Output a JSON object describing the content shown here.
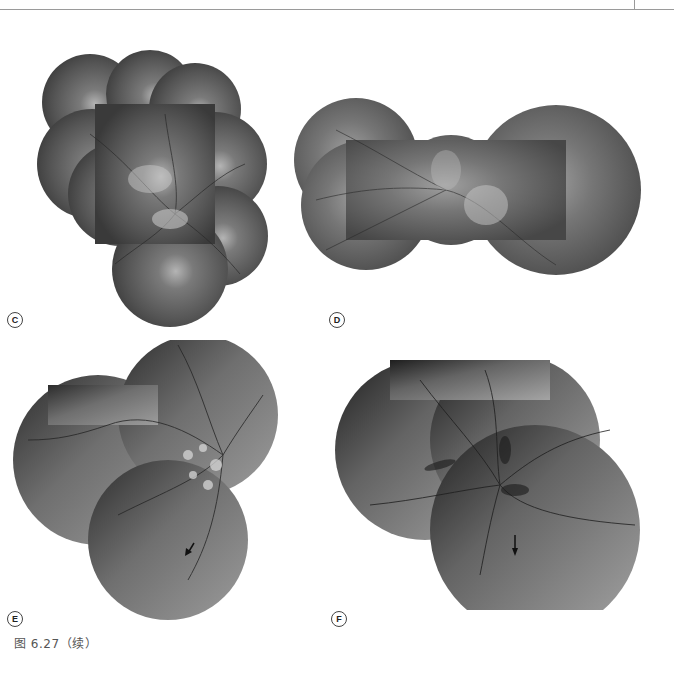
{
  "figure": {
    "caption": "图 6.27（续）",
    "panels": [
      {
        "id": "C",
        "label": "C",
        "has_arrow": false
      },
      {
        "id": "D",
        "label": "D",
        "has_arrow": false
      },
      {
        "id": "E",
        "label": "E",
        "has_arrow": true
      },
      {
        "id": "F",
        "label": "F",
        "has_arrow": true
      }
    ]
  },
  "colors": {
    "fundus_dark": "#2e2e2e",
    "fundus_mid": "#6a6a6a",
    "fundus_light": "#a8a8a8",
    "rule": "#9a9a9a"
  }
}
